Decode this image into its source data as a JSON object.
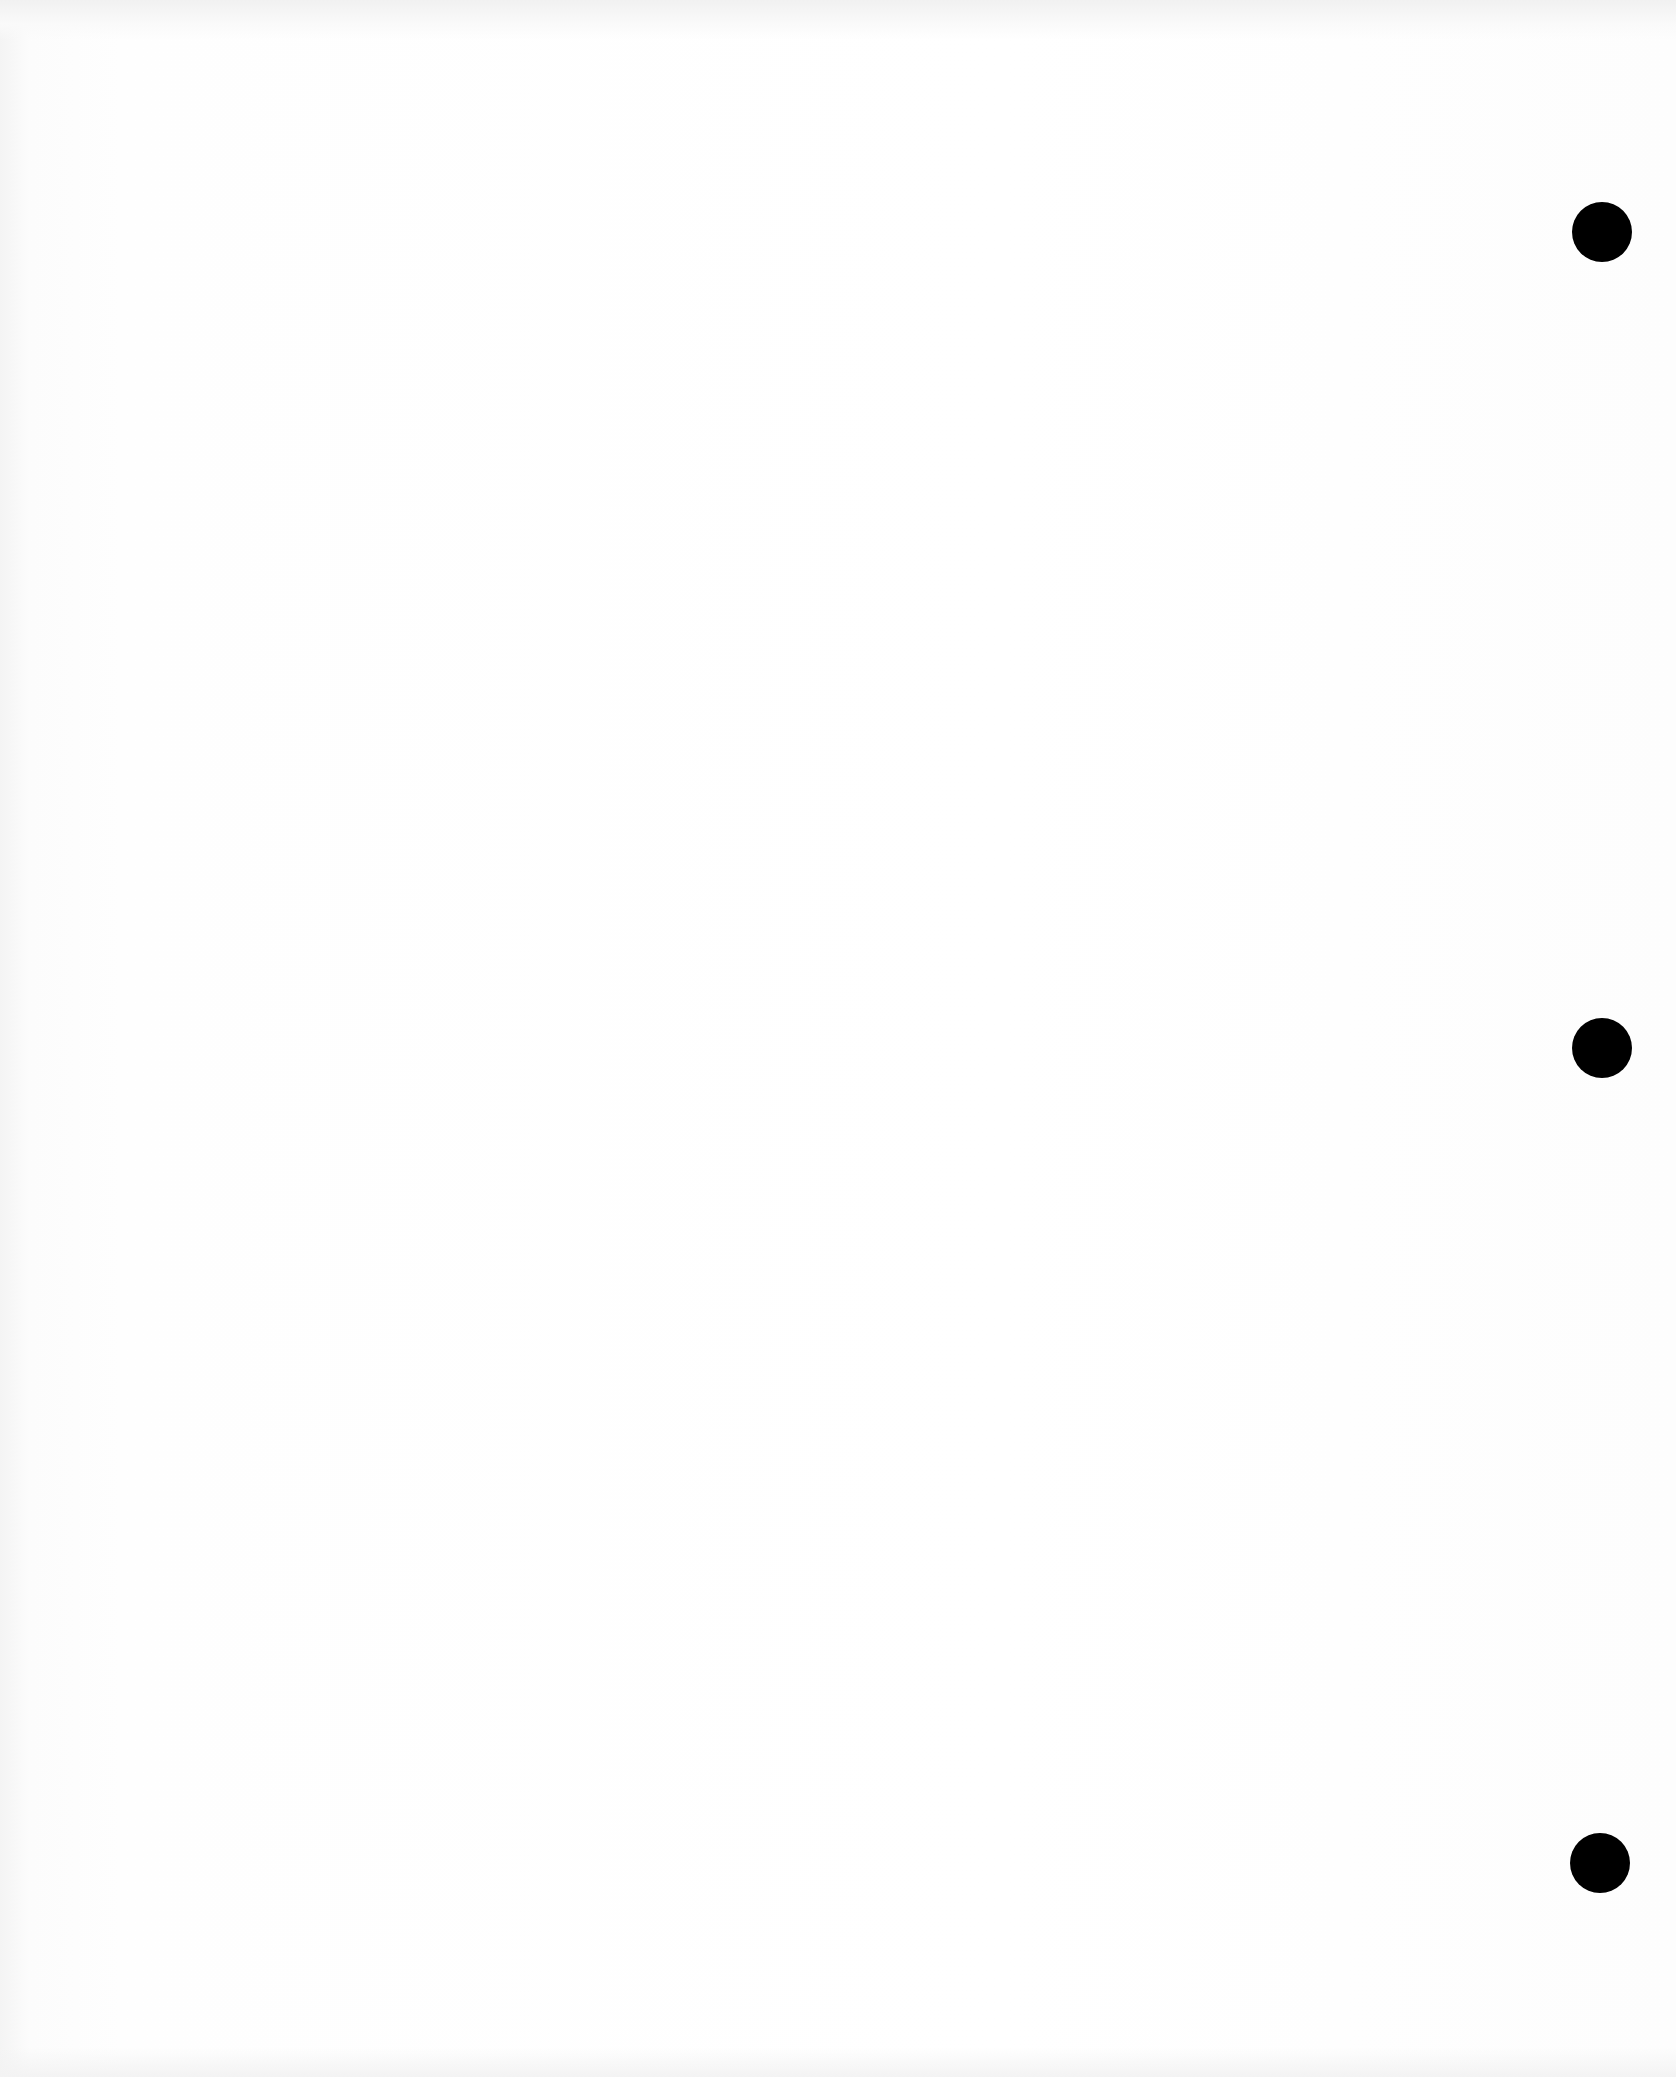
{
  "document": {
    "type": "blank scanned page",
    "text": "",
    "background_color": "#fefefe"
  },
  "punch_holes": [
    {
      "name": "top",
      "cx": 1602,
      "cy": 232,
      "diameter": 60,
      "color": "#000000"
    },
    {
      "name": "middle",
      "cx": 1602,
      "cy": 1048,
      "diameter": 60,
      "color": "#000000"
    },
    {
      "name": "bottom",
      "cx": 1600,
      "cy": 1863,
      "diameter": 60,
      "color": "#000000"
    }
  ]
}
